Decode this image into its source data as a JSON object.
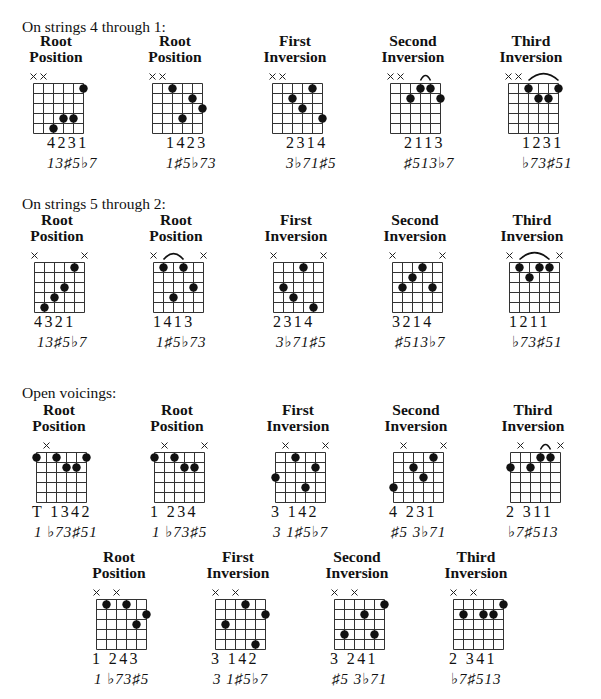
{
  "sections": [
    {
      "title": "On strings 4 through 1:",
      "chords": [
        {
          "title": [
            "Root",
            "Position"
          ],
          "muted": [
            0,
            1
          ],
          "dots": [
            [
              5,
              1
            ],
            [
              3,
              4
            ],
            [
              4,
              4
            ],
            [
              2,
              5
            ]
          ],
          "arcs": [],
          "fingering": "4231",
          "degrees": "13♯5♭7"
        },
        {
          "title": [
            "Root",
            "Position"
          ],
          "muted": [
            0,
            1
          ],
          "dots": [
            [
              2,
              1
            ],
            [
              4,
              2
            ],
            [
              5,
              3
            ],
            [
              3,
              4
            ]
          ],
          "arcs": [],
          "fingering": "1423",
          "degrees": "1♯5♭73"
        },
        {
          "title": [
            "First",
            "Inversion"
          ],
          "muted": [
            0,
            1
          ],
          "dots": [
            [
              4,
              1
            ],
            [
              2,
              2
            ],
            [
              3,
              3
            ],
            [
              5,
              4
            ]
          ],
          "arcs": [],
          "fingering": "2314",
          "degrees": "3♭71♯5"
        },
        {
          "title": [
            "Second",
            "Inversion"
          ],
          "muted": [
            0,
            1
          ],
          "dots": [
            [
              3,
              1
            ],
            [
              4,
              1
            ],
            [
              2,
              2
            ],
            [
              5,
              2
            ]
          ],
          "arcs": [
            [
              3,
              4
            ]
          ],
          "fingering": "2113",
          "degrees": "♯513♭7"
        },
        {
          "title": [
            "Third",
            "Inversion"
          ],
          "muted": [
            0,
            1
          ],
          "dots": [
            [
              2,
              1
            ],
            [
              5,
              1
            ],
            [
              3,
              2
            ],
            [
              4,
              2
            ]
          ],
          "arcs": [
            [
              2,
              5
            ]
          ],
          "fingering": "1231",
          "degrees": "♭73♯51"
        }
      ]
    },
    {
      "title": "On strings 5 through 2:",
      "chords": [
        {
          "title": [
            "Root",
            "Position"
          ],
          "muted": [
            0,
            5
          ],
          "dots": [
            [
              4,
              1
            ],
            [
              3,
              3
            ],
            [
              2,
              4
            ],
            [
              1,
              5
            ]
          ],
          "arcs": [],
          "fingering": "4321",
          "degrees": "13♯5♭7"
        },
        {
          "title": [
            "Root",
            "Position"
          ],
          "muted": [
            0,
            5
          ],
          "dots": [
            [
              1,
              1
            ],
            [
              3,
              1
            ],
            [
              4,
              3
            ],
            [
              2,
              4
            ]
          ],
          "arcs": [
            [
              1,
              3
            ]
          ],
          "fingering": "1413",
          "degrees": "1♯5♭73"
        },
        {
          "title": [
            "First",
            "Inversion"
          ],
          "muted": [
            0,
            5
          ],
          "dots": [
            [
              3,
              1
            ],
            [
              1,
              3
            ],
            [
              2,
              4
            ],
            [
              4,
              5
            ]
          ],
          "arcs": [],
          "fingering": "2314",
          "degrees": "3♭71♯5"
        },
        {
          "title": [
            "Second",
            "Inversion"
          ],
          "muted": [
            0,
            5
          ],
          "dots": [
            [
              3,
              1
            ],
            [
              2,
              2
            ],
            [
              1,
              3
            ],
            [
              4,
              3
            ]
          ],
          "arcs": [],
          "fingering": "3214",
          "degrees": "♯513♭7"
        },
        {
          "title": [
            "Third",
            "Inversion"
          ],
          "muted": [
            0,
            5
          ],
          "dots": [
            [
              1,
              1
            ],
            [
              3,
              1
            ],
            [
              4,
              1
            ],
            [
              2,
              2
            ]
          ],
          "arcs": [
            [
              1,
              4
            ]
          ],
          "fingering": "1211",
          "degrees": "♭73♯51"
        }
      ]
    },
    {
      "title": "Open voicings:",
      "chords": [
        {
          "title": [
            "Root",
            "Position"
          ],
          "muted": [
            1
          ],
          "dots": [
            [
              0,
              1
            ],
            [
              2,
              1
            ],
            [
              5,
              1
            ],
            [
              3,
              2
            ],
            [
              4,
              2
            ]
          ],
          "arcs": [],
          "fingering": "T 1342",
          "degrees": "1 ♭73♯51"
        },
        {
          "title": [
            "Root",
            "Position"
          ],
          "muted": [
            1,
            5
          ],
          "dots": [
            [
              0,
              1
            ],
            [
              2,
              1
            ],
            [
              3,
              2
            ],
            [
              4,
              2
            ]
          ],
          "arcs": [],
          "fingering": "1 234",
          "degrees": "1 ♭73♯5"
        },
        {
          "title": [
            "First",
            "Inversion"
          ],
          "muted": [
            1,
            5
          ],
          "dots": [
            [
              2,
              1
            ],
            [
              4,
              2
            ],
            [
              0,
              3
            ],
            [
              3,
              4
            ]
          ],
          "arcs": [],
          "fingering": "3 142",
          "degrees": "3 1♯5♭7"
        },
        {
          "title": [
            "Second",
            "Inversion"
          ],
          "muted": [
            1,
            5
          ],
          "dots": [
            [
              4,
              1
            ],
            [
              2,
              2
            ],
            [
              3,
              3
            ],
            [
              0,
              4
            ]
          ],
          "arcs": [],
          "fingering": "4 231",
          "degrees": "♯5 3♭71"
        },
        {
          "title": [
            "Third",
            "Inversion"
          ],
          "muted": [
            1,
            5
          ],
          "dots": [
            [
              3,
              1
            ],
            [
              4,
              1
            ],
            [
              0,
              2
            ],
            [
              2,
              2
            ]
          ],
          "arcs": [
            [
              3,
              4
            ]
          ],
          "fingering": "2 311",
          "degrees": "♭7♯513"
        }
      ]
    },
    {
      "title": "",
      "chords": [
        {
          "title": [
            "Root",
            "Position"
          ],
          "muted": [
            0,
            2
          ],
          "dots": [
            [
              1,
              1
            ],
            [
              3,
              1
            ],
            [
              5,
              2
            ],
            [
              4,
              3
            ]
          ],
          "arcs": [],
          "fingering": "1 243",
          "degrees": "1 ♭73♯5"
        },
        {
          "title": [
            "First",
            "Inversion"
          ],
          "muted": [
            0,
            2
          ],
          "dots": [
            [
              3,
              1
            ],
            [
              5,
              2
            ],
            [
              1,
              3
            ],
            [
              4,
              5
            ]
          ],
          "arcs": [],
          "fingering": "3 142",
          "degrees": "3 1♯5♭7"
        },
        {
          "title": [
            "Second",
            "Inversion"
          ],
          "muted": [
            0,
            2
          ],
          "dots": [
            [
              5,
              1
            ],
            [
              3,
              2
            ],
            [
              1,
              4
            ],
            [
              4,
              4
            ]
          ],
          "arcs": [],
          "fingering": "3 241",
          "degrees": "♯5 3♭71"
        },
        {
          "title": [
            "Third",
            "Inversion"
          ],
          "muted": [
            0,
            2
          ],
          "dots": [
            [
              5,
              1
            ],
            [
              1,
              2
            ],
            [
              3,
              2
            ],
            [
              4,
              2
            ]
          ],
          "arcs": [],
          "fingering": "2 341",
          "degrees": "♭7♯513"
        }
      ]
    }
  ]
}
